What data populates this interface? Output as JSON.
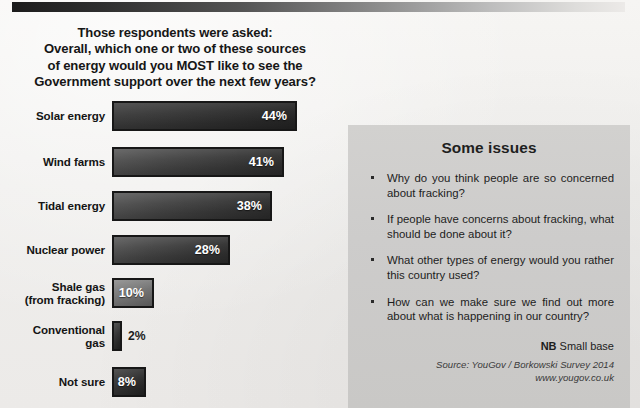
{
  "heading": {
    "line1": "Those respondents were asked:",
    "line2": "Overall, which one or two of these sources",
    "line3": "of energy would you MOST like to see the",
    "line4": "Government support over the next few years?"
  },
  "chart_data": {
    "type": "bar",
    "orientation": "horizontal",
    "title": "Overall, which one or two of these sources of energy would you MOST like to see the Government support over the next few years?",
    "xlabel": "",
    "ylabel": "",
    "xlim": [
      0,
      50
    ],
    "grid": false,
    "legend": false,
    "value_suffix": "%",
    "categories": [
      "Solar energy",
      "Wind farms",
      "Tidal energy",
      "Nuclear power",
      "Shale gas (from fracking)",
      "Conventional gas",
      "Not sure"
    ],
    "values": [
      44,
      41,
      38,
      28,
      10,
      2,
      8
    ],
    "labels": [
      "44%",
      "41%",
      "38%",
      "28%",
      "10%",
      "2%",
      "8%"
    ]
  },
  "bars": [
    {
      "label_line1": "Solar energy",
      "label_line2": "",
      "value": "44%",
      "width_px": 185,
      "shade": "dark",
      "label_inside": true
    },
    {
      "label_line1": "Wind farms",
      "label_line2": "",
      "value": "41%",
      "width_px": 172,
      "shade": "",
      "label_inside": true
    },
    {
      "label_line1": "Tidal energy",
      "label_line2": "",
      "value": "38%",
      "width_px": 160,
      "shade": "",
      "label_inside": true
    },
    {
      "label_line1": "Nuclear power",
      "label_line2": "",
      "value": "28%",
      "width_px": 118,
      "shade": "",
      "label_inside": true
    },
    {
      "label_line1": "Shale gas",
      "label_line2": "(from fracking)",
      "value": "10%",
      "width_px": 42,
      "shade": "light",
      "label_inside": true
    },
    {
      "label_line1": "Conventional",
      "label_line2": "gas",
      "value": "2%",
      "width_px": 10,
      "shade": "dark",
      "label_inside": false
    },
    {
      "label_line1": "Not sure",
      "label_line2": "",
      "value": "8%",
      "width_px": 34,
      "shade": "dark",
      "label_inside": true
    }
  ],
  "panel": {
    "title": "Some issues",
    "issues": [
      "Why do you think people are so concerned about fracking?",
      "If people have concerns about fracking, what should be done about it?",
      "What other types of energy would you rather this country used?",
      "How can we make sure we find out more about what is happening in our country?"
    ],
    "nb_label": "NB",
    "nb_text": " Small base",
    "source_line1": "Source: YouGov / Borkowski Survey 2014",
    "source_line2": "www.yougov.co.uk"
  }
}
